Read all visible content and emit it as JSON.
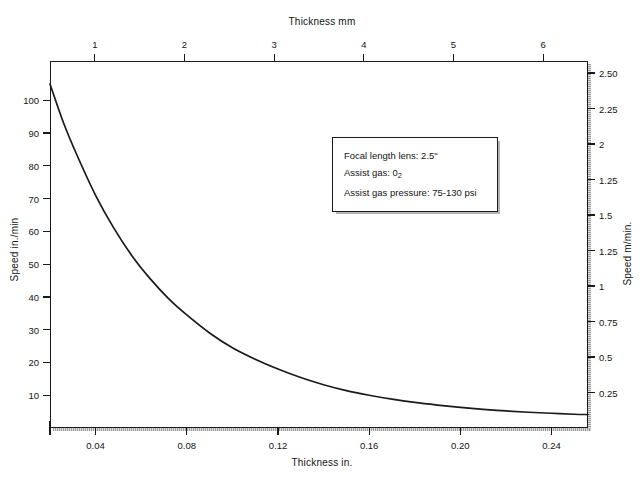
{
  "chart_data": {
    "type": "line",
    "title": "",
    "top_axis": {
      "label": "Thickness mm",
      "ticks": [
        1,
        2,
        3,
        4,
        5,
        6
      ],
      "tick_labels": [
        "1",
        "2",
        "3",
        "4",
        "5",
        "6"
      ],
      "range": [
        0.5,
        6.5
      ]
    },
    "bottom_axis": {
      "label": "Thickness in.",
      "ticks": [
        0.04,
        0.08,
        0.12,
        0.16,
        0.2,
        0.24
      ],
      "tick_labels": [
        "0.04",
        "0.08",
        "0.12",
        "0.16",
        "0.20",
        "0.24"
      ],
      "range": [
        0.02,
        0.256
      ]
    },
    "left_axis": {
      "label": "Speed in./min",
      "ticks": [
        10,
        20,
        30,
        40,
        50,
        60,
        70,
        80,
        90,
        100
      ],
      "tick_labels": [
        "10",
        "20",
        "30",
        "40",
        "50",
        "60",
        "70",
        "80",
        "90",
        "100"
      ],
      "range": [
        0,
        112
      ]
    },
    "right_axis": {
      "label": "Speed m/min.",
      "ticks": [
        0.25,
        0.5,
        0.75,
        1,
        1.25,
        1.5,
        1.25,
        2,
        2.25,
        2.5
      ],
      "tick_labels": [
        "0.25",
        "0.5",
        "0.75",
        "1",
        "1.25",
        "1.5",
        "1.25",
        "2",
        "2.25",
        "2.50"
      ],
      "range": [
        0,
        2.84
      ]
    },
    "grid": false,
    "legend": null,
    "xlabel": "Thickness in.",
    "ylabel": "Speed in./min",
    "x": [
      0.02,
      0.026,
      0.032,
      0.04,
      0.048,
      0.056,
      0.064,
      0.072,
      0.08,
      0.09,
      0.1,
      0.11,
      0.12,
      0.13,
      0.14,
      0.15,
      0.16,
      0.17,
      0.18,
      0.19,
      0.2,
      0.21,
      0.22,
      0.23,
      0.24,
      0.25,
      0.256
    ],
    "values": [
      105,
      93,
      83,
      71,
      61,
      52.5,
      45.5,
      39.5,
      34.5,
      29.0,
      24.5,
      21.0,
      18.0,
      15.4,
      13.2,
      11.4,
      10.0,
      8.8,
      7.8,
      7.0,
      6.3,
      5.7,
      5.2,
      4.8,
      4.5,
      4.2,
      4.1
    ],
    "series": [
      {
        "name": "Cutting speed vs thickness",
        "values": [
          105,
          93,
          83,
          71,
          61,
          52.5,
          45.5,
          39.5,
          34.5,
          29.0,
          24.5,
          21.0,
          18.0,
          15.4,
          13.2,
          11.4,
          10.0,
          8.8,
          7.8,
          7.0,
          6.3,
          5.7,
          5.2,
          4.8,
          4.5,
          4.2,
          4.1
        ],
        "color": "#1a1a1a"
      }
    ],
    "annotations": [
      {
        "id": "focal-length",
        "text": "Focal length lens:  2.5\""
      },
      {
        "id": "assist-gas",
        "text_before": "Assist gas:  0",
        "subscript": "2",
        "text_after": ""
      },
      {
        "id": "assist-gas-pressure",
        "text": "Assist gas pressure:  75-130 psi"
      }
    ]
  },
  "annotation_box": {
    "line1": "Focal length lens:  2.5\"",
    "line2_prefix": "Assist gas:  0",
    "line2_sub": "2",
    "line3": "Assist gas pressure:  75-130 psi"
  },
  "colors": {
    "curve": "#1a1a1a",
    "frame": "#1a1a1a",
    "text": "#141414",
    "background": "#ffffff",
    "shadow": "#8d8d8d"
  }
}
